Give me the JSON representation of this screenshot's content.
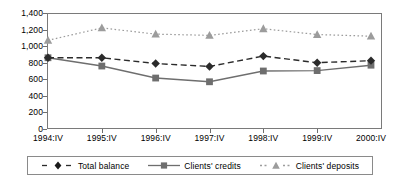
{
  "chart_data": {
    "type": "line",
    "title": "",
    "subtitle": "",
    "xlabel": "",
    "ylabel": "",
    "categories": [
      "1994:IV",
      "1995:IV",
      "1996:IV",
      "1997:IV",
      "1998:IV",
      "1999:IV",
      "2000:IV"
    ],
    "ylim": [
      0,
      1400
    ],
    "yticks": [
      0,
      200,
      400,
      600,
      800,
      1000,
      1200,
      1400
    ],
    "ytick_labels": [
      "0",
      "200",
      "400",
      "600",
      "800",
      "1,000",
      "1,200",
      "1,400"
    ],
    "grid": false,
    "legend_position": "bottom",
    "series": [
      {
        "name": "Total balance",
        "values": [
          860,
          860,
          790,
          755,
          880,
          800,
          825
        ],
        "color": "#2b2b2b",
        "marker": "diamond",
        "linestyle": "dashed"
      },
      {
        "name": "Clients' credits",
        "values": [
          860,
          760,
          615,
          570,
          700,
          705,
          770
        ],
        "color": "#6e6e6e",
        "marker": "square",
        "linestyle": "solid"
      },
      {
        "name": "Clients' deposits",
        "values": [
          1070,
          1220,
          1145,
          1130,
          1210,
          1140,
          1120
        ],
        "color": "#9c9c9c",
        "marker": "triangle",
        "linestyle": "dotted"
      }
    ]
  },
  "legend": {
    "items": [
      {
        "label": "Total balance"
      },
      {
        "label": "Clients' credits"
      },
      {
        "label": "Clients' deposits"
      }
    ]
  },
  "axis": {
    "y_labels": [
      "1,400",
      "1,200",
      "1,000",
      "800",
      "600",
      "400",
      "200",
      "0"
    ],
    "x_labels": [
      "1994:IV",
      "1995:IV",
      "1996:IV",
      "1997:IV",
      "1998:IV",
      "1999:IV",
      "2000:IV"
    ]
  },
  "colors": {
    "frame": "#7a7a7a",
    "total_balance": "#2b2b2b",
    "clients_credits": "#6e6e6e",
    "clients_deposits": "#9c9c9c",
    "background": "#ffffff"
  }
}
